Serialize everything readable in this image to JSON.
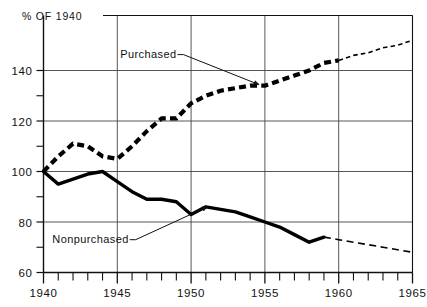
{
  "chart_data": {
    "type": "line",
    "title": "% OF 1940",
    "xlabel": "",
    "ylabel": "% OF 1940",
    "xlim": [
      1940,
      1965
    ],
    "ylim": [
      60,
      150
    ],
    "yticks": [
      60,
      80,
      100,
      120,
      140
    ],
    "yticks_minor": [
      70,
      90,
      110,
      130
    ],
    "xticks": [
      1940,
      1945,
      1950,
      1955,
      1960,
      1965
    ],
    "xticks_minor": [
      1941,
      1942,
      1943,
      1944,
      1946,
      1947,
      1948,
      1949,
      1951,
      1952,
      1953,
      1954,
      1956,
      1957,
      1958,
      1959,
      1961,
      1962,
      1963,
      1964
    ],
    "grid": "major-both",
    "legend": "inline-annotations",
    "series": [
      {
        "name": "Purchased",
        "style": "dashed-heavy",
        "color": "#000000",
        "x": [
          1940,
          1941,
          1942,
          1943,
          1944,
          1945,
          1946,
          1947,
          1948,
          1949,
          1950,
          1951,
          1952,
          1953,
          1954,
          1955,
          1956,
          1957,
          1958,
          1959,
          1960
        ],
        "values": [
          100,
          106,
          111,
          110,
          106,
          105,
          110,
          116,
          121,
          121,
          127,
          130,
          132,
          133,
          134,
          134,
          136,
          138,
          140,
          143,
          144
        ]
      },
      {
        "name": "Purchased (projected)",
        "style": "dotted-fine",
        "color": "#000000",
        "x": [
          1960,
          1961,
          1962,
          1963,
          1964,
          1965
        ],
        "values": [
          144,
          146,
          147,
          149,
          150,
          152
        ]
      },
      {
        "name": "Nonpurchased",
        "style": "solid-heavy",
        "color": "#000000",
        "x": [
          1940,
          1941,
          1942,
          1943,
          1944,
          1945,
          1946,
          1947,
          1948,
          1949,
          1950,
          1951,
          1952,
          1953,
          1954,
          1955,
          1956,
          1957,
          1958,
          1959
        ],
        "values": [
          100,
          95,
          97,
          99,
          100,
          96,
          92,
          89,
          89,
          88,
          83,
          86,
          85,
          84,
          82,
          80,
          78,
          75,
          72,
          74
        ]
      },
      {
        "name": "Nonpurchased (projected)",
        "style": "dashed-fine",
        "color": "#000000",
        "x": [
          1959,
          1960,
          1961,
          1962,
          1963,
          1964,
          1965
        ],
        "values": [
          74,
          73,
          72,
          71,
          70,
          69,
          68
        ]
      }
    ],
    "annotations": [
      {
        "text": "Purchased",
        "label_x": 1945.2,
        "label_y": 146.5,
        "target_x": 1954.6,
        "target_y": 134.4
      },
      {
        "text": "Nonpurchased",
        "label_x": 1940.6,
        "label_y": 73.2,
        "target_x": 1951.1,
        "target_y": 86.0
      }
    ],
    "ytick_labels": [
      "60",
      "80",
      "100",
      "120",
      "140"
    ],
    "xtick_labels": [
      "1940",
      "1945",
      "1950",
      "1955",
      "1960",
      "1965"
    ]
  }
}
